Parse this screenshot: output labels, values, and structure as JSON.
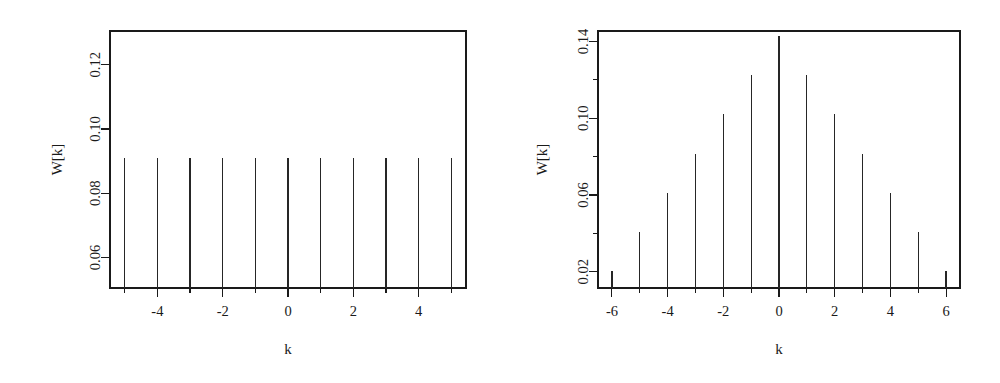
{
  "figure": {
    "background": "#ffffff",
    "ink_color": "#1a1a1a",
    "panel_count": 2
  },
  "panels": [
    {
      "id": "left",
      "name": "rectangular-window",
      "xlabel": "k",
      "ylabel": "W[k]",
      "x_ticks_major": [
        "-4",
        "-2",
        "0",
        "2",
        "4"
      ],
      "x_ticks_major_values": [
        -4,
        -2,
        0,
        2,
        4
      ],
      "x_ticks_minor_values": [
        -5,
        -3,
        -1,
        1,
        3,
        5
      ],
      "y_ticks_major": [
        "0.06",
        "0.08",
        "0.10",
        "0.12"
      ],
      "y_ticks_major_values": [
        0.06,
        0.08,
        0.1,
        0.12
      ],
      "xlim": [
        -5.45,
        5.45
      ],
      "ylim": [
        0.0505,
        0.1305
      ]
    },
    {
      "id": "right",
      "name": "triangular-window",
      "xlabel": "k",
      "ylabel": "W[k]",
      "x_ticks_major": [
        "-6",
        "-4",
        "-2",
        "0",
        "2",
        "4",
        "6"
      ],
      "x_ticks_major_values": [
        -6,
        -4,
        -2,
        0,
        2,
        4,
        6
      ],
      "x_ticks_minor_values": [
        -5,
        -3,
        -1,
        1,
        3,
        5
      ],
      "y_ticks_major": [
        "0.02",
        "0.06",
        "0.10",
        "0.14"
      ],
      "y_ticks_major_values": [
        0.02,
        0.06,
        0.1,
        0.14
      ],
      "y_ticks_minor_values": [
        0.04,
        0.08,
        0.12
      ],
      "xlim": [
        -6.5,
        6.5
      ],
      "ylim": [
        0.0115,
        0.1455
      ]
    }
  ],
  "chart_data": [
    {
      "type": "bar",
      "title": "",
      "subtitle": "",
      "xlabel": "k",
      "ylabel": "W[k]",
      "categories": [
        "-5",
        "-4",
        "-3",
        "-2",
        "-1",
        "0",
        "1",
        "2",
        "3",
        "4",
        "5"
      ],
      "x": [
        -5,
        -4,
        -3,
        -2,
        -1,
        0,
        1,
        2,
        3,
        4,
        5
      ],
      "values": [
        0.0909,
        0.0909,
        0.0909,
        0.0909,
        0.0909,
        0.0909,
        0.0909,
        0.0909,
        0.0909,
        0.0909,
        0.0909
      ],
      "xlim": [
        -5.45,
        5.45
      ],
      "ylim": [
        0.0505,
        0.1305
      ],
      "xticks": [
        -4,
        -2,
        0,
        2,
        4
      ],
      "xticklabels": [
        "-4",
        "-2",
        "0",
        "2",
        "4"
      ],
      "yticks": [
        0.06,
        0.08,
        0.1,
        0.12
      ],
      "yticklabels": [
        "0.06",
        "0.08",
        "0.10",
        "0.12"
      ],
      "grid": false,
      "legend": false
    },
    {
      "type": "bar",
      "title": "",
      "subtitle": "",
      "xlabel": "k",
      "ylabel": "W[k]",
      "categories": [
        "-6",
        "-5",
        "-4",
        "-3",
        "-2",
        "-1",
        "0",
        "1",
        "2",
        "3",
        "4",
        "5",
        "6"
      ],
      "x": [
        -6,
        -5,
        -4,
        -3,
        -2,
        -1,
        0,
        1,
        2,
        3,
        4,
        5,
        6
      ],
      "values": [
        0.0204,
        0.0408,
        0.0612,
        0.0816,
        0.102,
        0.1224,
        0.1428,
        0.1224,
        0.102,
        0.0816,
        0.0612,
        0.0408,
        0.0204
      ],
      "xlim": [
        -6.5,
        6.5
      ],
      "ylim": [
        0.0115,
        0.1455
      ],
      "xticks": [
        -6,
        -4,
        -2,
        0,
        2,
        4,
        6
      ],
      "xticklabels": [
        "-6",
        "-4",
        "-2",
        "0",
        "2",
        "4",
        "6"
      ],
      "yticks": [
        0.02,
        0.06,
        0.1,
        0.14
      ],
      "yticklabels": [
        "0.02",
        "0.06",
        "0.10",
        "0.14"
      ],
      "grid": false,
      "legend": false
    }
  ]
}
